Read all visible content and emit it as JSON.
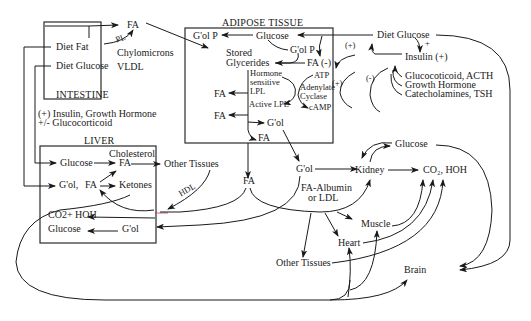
{
  "compartments": {
    "intestine": {
      "title": "INTESTINE",
      "items": [
        "Diet Fat",
        "Diet Glucose"
      ]
    },
    "adipose": {
      "title": "ADIPOSE TISSUE",
      "items": [
        "G'ol P",
        "Glucose",
        "G'ol P",
        "Stored",
        "Glycerides",
        "FA (-)",
        "Hormone",
        "sensitive",
        "LPL",
        "ATP",
        "Adenylate",
        "Cyclase",
        "cAMP",
        "Active LPL",
        "FA",
        "FA",
        "G'ol",
        "FA"
      ]
    },
    "liver": {
      "title": "LIVER",
      "items": [
        "Glucose",
        "Cholesterol",
        "FA",
        "G'ol,",
        "FA",
        "Ketones",
        "CO2+ HOH",
        "Glucose",
        "G'ol"
      ]
    }
  },
  "labels": {
    "fa_top": "FA",
    "pl": "PL",
    "chylomicrons": "Chylomicrons",
    "vldl": "VLDL",
    "liver_regulators_1": "(+) Insulin, Growth Hormone",
    "liver_regulators_2": "+/- Glucocorticoid",
    "diet_glucose_right": "Diet Glucose",
    "plus_small": "+",
    "insulin": "Insulin (+)",
    "plus_paren_1": "(+)",
    "plus_paren_2": "(+)",
    "minus_paren_1": "(-)",
    "minus_paren_2": "(-)",
    "gluco_1": "Glucocoticoid, ACTH",
    "gluco_2": "Growth Hormone",
    "gluco_3": "Catecholamines, TSH",
    "other_tissues_top": "Other Tissues",
    "hdl": "HDL",
    "fa_mid": "FA",
    "gol_mid": "G'ol",
    "kidney": "Kidney",
    "glucose_right": "Glucose",
    "co2_hoh_right": "CO₂, HOH",
    "fa_albumin": "FA-Albumin",
    "or_ldl": "or LDL",
    "muscle": "Muscle",
    "heart": "Heart",
    "other_tissues_bottom": "Other Tissues",
    "brain": "Brain"
  }
}
